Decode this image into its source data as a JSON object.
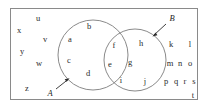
{
  "diagram": {
    "type": "venn-two-set",
    "stroke_color": "#8a8a8a",
    "text_color": "#2b2b2b",
    "background_color": "#ffffff",
    "universe": {
      "shape": "rectangle",
      "x": 10,
      "y": 8,
      "width": 188,
      "height": 92
    },
    "set_a": {
      "label": "A",
      "label_x": 50,
      "label_y": 93,
      "circle": {
        "cx": 93,
        "cy": 55,
        "r": 35
      },
      "arrow": {
        "from_x": 56,
        "from_y": 89,
        "to_x": 69,
        "to_y": 79
      }
    },
    "set_b": {
      "label": "B",
      "label_x": 172,
      "label_y": 18,
      "circle": {
        "cx": 135,
        "cy": 60,
        "r": 31
      },
      "arrow": {
        "from_x": 166,
        "from_y": 24,
        "to_x": 153,
        "to_y": 36
      }
    },
    "regions": {
      "a_only": {
        "name": "A only",
        "members": [
          "a",
          "b",
          "c",
          "d"
        ]
      },
      "intersection": {
        "name": "A and B",
        "members": [
          "f",
          "e"
        ]
      },
      "b_only": {
        "name": "B only",
        "members": [
          "h",
          "g",
          "i",
          "j"
        ]
      },
      "outside": {
        "name": "Outside A and B",
        "members": [
          "u",
          "x",
          "v",
          "y",
          "w",
          "z",
          "k",
          "l",
          "m",
          "n",
          "o",
          "p",
          "q",
          "r",
          "s",
          "t"
        ]
      }
    },
    "elements": [
      {
        "text": "u",
        "x": 38,
        "y": 18,
        "region": "outside"
      },
      {
        "text": "x",
        "x": 19,
        "y": 30,
        "region": "outside"
      },
      {
        "text": "v",
        "x": 45,
        "y": 39,
        "region": "outside"
      },
      {
        "text": "y",
        "x": 22,
        "y": 51,
        "region": "outside"
      },
      {
        "text": "w",
        "x": 39,
        "y": 63,
        "region": "outside"
      },
      {
        "text": "z",
        "x": 27,
        "y": 88,
        "region": "outside"
      },
      {
        "text": "b",
        "x": 89,
        "y": 26,
        "region": "a_only"
      },
      {
        "text": "a",
        "x": 70,
        "y": 39,
        "region": "a_only"
      },
      {
        "text": "c",
        "x": 69,
        "y": 60,
        "region": "a_only"
      },
      {
        "text": "d",
        "x": 88,
        "y": 73,
        "region": "a_only"
      },
      {
        "text": "f",
        "x": 114,
        "y": 45,
        "region": "intersection"
      },
      {
        "text": "e",
        "x": 110,
        "y": 64,
        "region": "intersection"
      },
      {
        "text": "h",
        "x": 141,
        "y": 43,
        "region": "b_only"
      },
      {
        "text": "g",
        "x": 130,
        "y": 62,
        "region": "b_only"
      },
      {
        "text": "i",
        "x": 121,
        "y": 80,
        "region": "b_only"
      },
      {
        "text": "j",
        "x": 145,
        "y": 81,
        "region": "b_only"
      },
      {
        "text": "k",
        "x": 171,
        "y": 44,
        "region": "outside"
      },
      {
        "text": "l",
        "x": 190,
        "y": 44,
        "region": "outside"
      },
      {
        "text": "m",
        "x": 170,
        "y": 63,
        "region": "outside"
      },
      {
        "text": "n",
        "x": 180,
        "y": 63,
        "region": "outside"
      },
      {
        "text": "o",
        "x": 190,
        "y": 63,
        "region": "outside"
      },
      {
        "text": "p",
        "x": 166,
        "y": 81,
        "region": "outside"
      },
      {
        "text": "q",
        "x": 176,
        "y": 81,
        "region": "outside"
      },
      {
        "text": "r",
        "x": 185,
        "y": 81,
        "region": "outside"
      },
      {
        "text": "s",
        "x": 194,
        "y": 81,
        "region": "outside"
      },
      {
        "text": "t",
        "x": 193,
        "y": 95,
        "region": "outside"
      }
    ]
  }
}
